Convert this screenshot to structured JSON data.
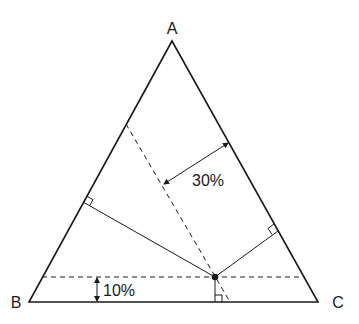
{
  "diagram": {
    "type": "ternary-phase-diagram",
    "vertices": {
      "A": {
        "label": "A",
        "x": 172,
        "y": 41
      },
      "B": {
        "label": "B",
        "x": 29,
        "y": 302
      },
      "C": {
        "label": "C",
        "x": 318,
        "y": 302
      }
    },
    "point": {
      "x": 215,
      "y": 277
    },
    "perpendicular_feet": {
      "to_AB": {
        "x": 83,
        "y": 202
      },
      "to_AC": {
        "x": 278,
        "y": 231
      },
      "to_BC": {
        "x": 215,
        "y": 302
      }
    },
    "annotations": {
      "a_composition": "30%",
      "bc_composition": "10%"
    },
    "colors": {
      "line": "#1a1a1a",
      "background": "#ffffff"
    }
  }
}
